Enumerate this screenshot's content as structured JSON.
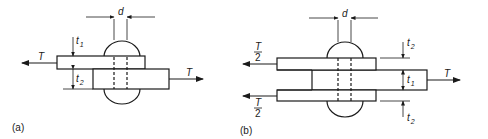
{
  "diagram": {
    "type": "riveted lap and butt joints",
    "panels": [
      {
        "id": "a",
        "caption": "(a)",
        "description": "single lap joint",
        "labels": {
          "diameter": "d",
          "load_left": "T",
          "load_right": "T",
          "thickness_top": "t",
          "thickness_top_sub": "1",
          "thickness_bottom": "t",
          "thickness_bottom_sub": "2"
        }
      },
      {
        "id": "b",
        "caption": "(b)",
        "description": "double cover-plate butt joint",
        "labels": {
          "diameter": "d",
          "load_left_top_num": "T",
          "load_left_top_den": "2",
          "load_left_bottom_num": "T",
          "load_left_bottom_den": "2",
          "load_right": "T",
          "thickness_top": "t",
          "thickness_top_sub": "2",
          "thickness_middle": "t",
          "thickness_middle_sub": "1",
          "thickness_bottom": "t",
          "thickness_bottom_sub": "2"
        }
      }
    ],
    "colors": {
      "line": "#1a1a1a",
      "background": "#ffffff"
    }
  }
}
